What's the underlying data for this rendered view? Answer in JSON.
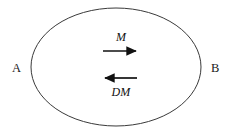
{
  "figure": {
    "kind": "vector-diagram",
    "background_color": "#ffffff",
    "stroke_color": "#333333",
    "text_color": "#1a1a1a",
    "width": 236,
    "height": 134,
    "boundary": {
      "shape": "ellipse",
      "center_x": 116,
      "center_y": 67,
      "radius_x": 85,
      "radius_y": 59,
      "stroke_width": 1,
      "fill": "none"
    },
    "endpoint_labels": [
      {
        "name": "left-endpoint",
        "text": "A",
        "x": 17,
        "y": 69
      },
      {
        "name": "right-endpoint",
        "text": "B",
        "x": 216,
        "y": 69
      }
    ],
    "vectors": [
      {
        "name": "forward-vector",
        "label": "M",
        "direction": "right",
        "x1": 103,
        "y1": 51,
        "x2": 138,
        "y2": 51,
        "label_position": "above",
        "stroke_width": 1.6,
        "color": "#111111"
      },
      {
        "name": "reverse-vector",
        "label": "DM",
        "direction": "left",
        "x1": 137,
        "y1": 78,
        "x2": 103,
        "y2": 78,
        "label_position": "below",
        "stroke_width": 1.6,
        "color": "#111111"
      }
    ]
  }
}
